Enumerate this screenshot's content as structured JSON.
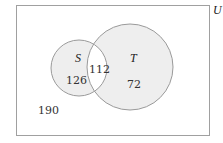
{
  "diagram": {
    "type": "venn",
    "universe": {
      "label": "U",
      "outside_count": "190"
    },
    "sets": [
      {
        "name": "S",
        "label": "S",
        "only_count": "126"
      },
      {
        "name": "T",
        "label": "T",
        "only_count": "72"
      }
    ],
    "intersection": {
      "sets": [
        "S",
        "T"
      ],
      "count": "112"
    },
    "colors": {
      "set_fill": "#eeeeee",
      "intersection_fill": "#ffffff",
      "stroke": "#9a9a9a",
      "universe_stroke": "#a0a0a0",
      "text": "#333333"
    }
  }
}
